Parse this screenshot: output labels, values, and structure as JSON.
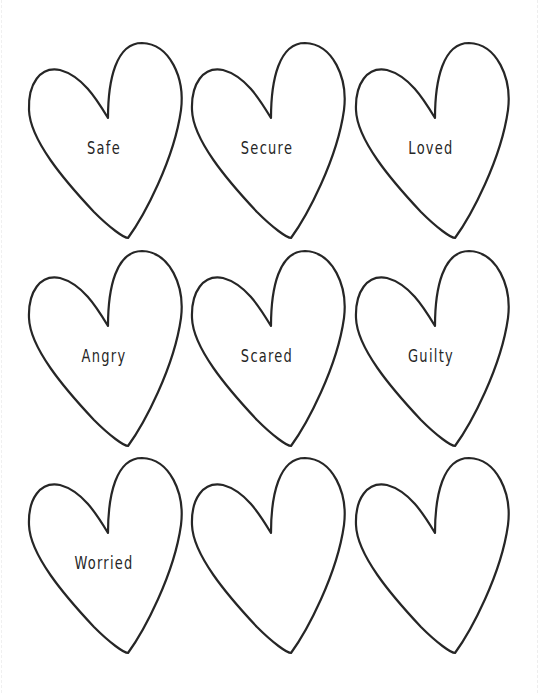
{
  "page": {
    "background": "#ffffff",
    "stroke_color": "#262626",
    "header_remnant": ""
  },
  "hearts": [
    {
      "label": "Safe",
      "row": 0,
      "col": 0
    },
    {
      "label": "Secure",
      "row": 0,
      "col": 1
    },
    {
      "label": "Loved",
      "row": 0,
      "col": 2
    },
    {
      "label": "Angry",
      "row": 1,
      "col": 0
    },
    {
      "label": "Scared",
      "row": 1,
      "col": 1
    },
    {
      "label": "Guilty",
      "row": 1,
      "col": 2
    },
    {
      "label": "Worried",
      "row": 2,
      "col": 0
    },
    {
      "label": "",
      "row": 2,
      "col": 1
    },
    {
      "label": "",
      "row": 2,
      "col": 2
    }
  ]
}
